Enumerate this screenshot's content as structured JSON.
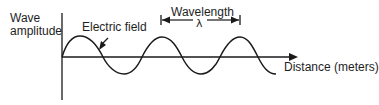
{
  "diagram": {
    "y_axis": {
      "label_line1": "Wave",
      "label_line2": "amplitude"
    },
    "x_axis": {
      "label": "Distance (meters)"
    },
    "wave": {
      "label": "Electric field",
      "type": "sinusoid",
      "cycles_shown": 2.75
    },
    "wavelength": {
      "label": "Wavelength",
      "symbol": "λ"
    },
    "colors": {
      "stroke": "#1a1a1a",
      "background": "#ffffff"
    }
  }
}
